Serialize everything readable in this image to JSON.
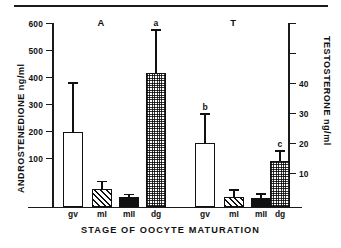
{
  "figure": {
    "background_color": "#ffffff",
    "ink_color": "#111111"
  },
  "chart_data": {
    "type": "bar",
    "title": "",
    "xlabel": "STAGE OF OOCYTE MATURATION",
    "ylabel": "ANDROSTENEDIONE  ng/ml",
    "y2label": "TESTOSTERONE  ng/ml",
    "ylim": [
      0,
      600
    ],
    "y2lim": [
      0,
      60
    ],
    "yticks": [
      100,
      200,
      300,
      400,
      500,
      600
    ],
    "ytick_labels": [
      "100",
      "200",
      "300",
      "400",
      "500",
      "600"
    ],
    "y2ticks": [
      10,
      20,
      30,
      40,
      50
    ],
    "y2tick_labels": [
      "10",
      "20",
      "30",
      "40",
      ""
    ],
    "grid": false,
    "legend": "none",
    "categories": [
      "gv",
      "mI",
      "mII",
      "dg"
    ],
    "groups": [
      {
        "name": "A",
        "group_label": "A",
        "axis": "left",
        "units": "ng/ml",
        "bars": [
          {
            "category": "gv",
            "value": 243,
            "error": 165,
            "fill": "white",
            "letter": ""
          },
          {
            "category": "mI",
            "value": 58,
            "error": 27,
            "fill": "hatch",
            "letter": ""
          },
          {
            "category": "mII",
            "value": 31,
            "error": 11,
            "fill": "black",
            "letter": ""
          },
          {
            "category": "dg",
            "value": 438,
            "error": 143,
            "fill": "dots",
            "letter": "a"
          }
        ]
      },
      {
        "name": "T",
        "group_label": "T",
        "axis": "right",
        "units": "ng/ml",
        "bars": [
          {
            "category": "gv",
            "value": 20.7,
            "error": 9.8,
            "fill": "white",
            "letter": "b"
          },
          {
            "category": "mI",
            "value": 3.2,
            "error": 2.6,
            "fill": "hatch",
            "letter": ""
          },
          {
            "category": "mII",
            "value": 2.9,
            "error": 1.4,
            "fill": "black",
            "letter": ""
          },
          {
            "category": "dg",
            "value": 15.0,
            "error": 3.4,
            "fill": "dots",
            "letter": "c"
          }
        ]
      }
    ]
  },
  "ticks": {
    "left": [
      {
        "label": "600",
        "y": 23
      },
      {
        "label": "500",
        "y": 50
      },
      {
        "label": "400",
        "y": 77
      },
      {
        "label": "300",
        "y": 104
      },
      {
        "label": "200",
        "y": 131
      },
      {
        "label": "100",
        "y": 158
      }
    ],
    "right": [
      {
        "label": "",
        "y": 23
      },
      {
        "label": "",
        "y": 53
      },
      {
        "label": "40",
        "y": 83
      },
      {
        "label": "30",
        "y": 113
      },
      {
        "label": "20",
        "y": 143
      },
      {
        "label": "10",
        "y": 173
      }
    ]
  }
}
